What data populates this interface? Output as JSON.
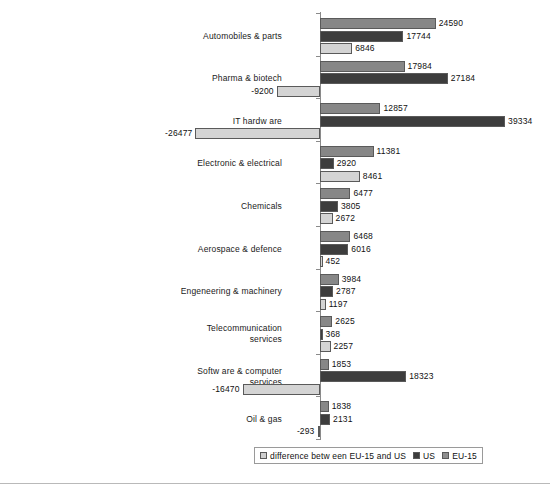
{
  "chart_data": {
    "type": "bar",
    "orientation": "horizontal",
    "title": "",
    "xlabel": "",
    "ylabel": "",
    "grid": false,
    "legend_position": "bottom",
    "xlim": [
      -30000,
      42000
    ],
    "axis_zero": 0,
    "categories": [
      "Automobiles & parts",
      "Pharma & biotech",
      "IT hardw are",
      "Electronic & electrical",
      "Chemicals",
      "Aerospace & defence",
      "Engeneering & machinery",
      "Telecommunication\nservices",
      "Softw are & computer\nservices",
      "Oil & gas"
    ],
    "series": [
      {
        "name": "difference betw een EU-15 and US",
        "color": "#878787",
        "values": [
          24590,
          17984,
          12857,
          11381,
          6477,
          6468,
          3984,
          2625,
          1853,
          1838
        ]
      },
      {
        "name": "US",
        "color": "#3d3d3d",
        "values": [
          17744,
          27184,
          39334,
          2920,
          3805,
          6016,
          2787,
          368,
          18323,
          2131
        ]
      },
      {
        "name": "EU-15",
        "color": "#d4d4d4",
        "values": [
          6846,
          -9200,
          -26477,
          8461,
          2672,
          452,
          1197,
          2257,
          -16470,
          -293
        ]
      }
    ],
    "value_labels": [
      [
        "24590",
        "17744",
        "6846"
      ],
      [
        "17984",
        "27184",
        "-9200"
      ],
      [
        "12857",
        "39334",
        "-26477"
      ],
      [
        "11381",
        "2920",
        "8461"
      ],
      [
        "6477",
        "3805",
        "2672"
      ],
      [
        "6468",
        "6016",
        "452"
      ],
      [
        "3984",
        "2787",
        "1197"
      ],
      [
        "2625",
        "368",
        "2257"
      ],
      [
        "1853",
        "18323",
        "-16470"
      ],
      [
        "1838",
        "2131",
        "-293"
      ]
    ]
  },
  "legend": {
    "items": [
      {
        "label": "difference betw een EU-15 and US",
        "swatch": "#cfcfcf"
      },
      {
        "label": "US",
        "swatch": "#3d3d3d"
      },
      {
        "label": "EU-15",
        "swatch": "#8f8f8f"
      }
    ]
  }
}
